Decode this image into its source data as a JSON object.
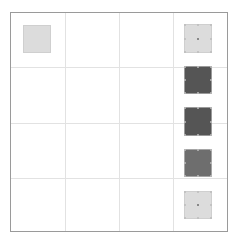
{
  "canvas": {
    "background": "#ffffff",
    "grid": {
      "rows": 4,
      "columns": 4,
      "border_color": "#9a9a9a",
      "line_color": "#e2e2e2"
    }
  },
  "shapes": [
    {
      "id": "square-1",
      "column": 1,
      "row": 1,
      "color": "#dcdcdc",
      "selected": false
    },
    {
      "id": "square-2",
      "column": 4,
      "row": 1,
      "color": "#dcdcdc",
      "selected": true
    },
    {
      "id": "square-3",
      "column": 4,
      "row": 2,
      "color": "#555555",
      "selected": true
    },
    {
      "id": "square-4",
      "column": 4,
      "row": 2.7,
      "color": "#555555",
      "selected": true
    },
    {
      "id": "square-5",
      "column": 4,
      "row": 3.4,
      "color": "#6e6e6e",
      "selected": true
    },
    {
      "id": "square-6",
      "column": 4,
      "row": 4,
      "color": "#dcdcdc",
      "selected": true
    }
  ]
}
